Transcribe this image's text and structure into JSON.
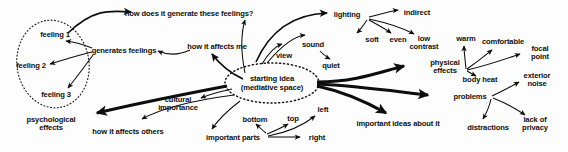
{
  "diagram": {
    "type": "mind-map",
    "title_text": "starting idea (mediative space)",
    "background_color": "#fdfdfd",
    "ink_color": "#0d0d0d",
    "center": {
      "line1": "starting idea",
      "line2": "(mediative space)"
    },
    "groups": [
      {
        "name": "feelings-group",
        "shape": "dotted-ellipse",
        "members": [
          "feeling 1",
          "feeling 2",
          "feeling 3"
        ]
      },
      {
        "name": "starting-idea-group",
        "shape": "dotted-ellipse",
        "members": [
          "starting idea (mediative space)"
        ]
      }
    ],
    "nodes": [
      {
        "id": "feeling1",
        "label": "feeling 1",
        "x": 55,
        "y": 35
      },
      {
        "id": "feeling2",
        "label": "feeling 2",
        "x": 31,
        "y": 66
      },
      {
        "id": "feeling3",
        "label": "feeling 3",
        "x": 56,
        "y": 95
      },
      {
        "id": "generates_feelings",
        "label": "generates feelings",
        "x": 124,
        "y": 51
      },
      {
        "id": "how_generate",
        "label": "how does it generate these feelings?",
        "x": 189,
        "y": 14
      },
      {
        "id": "how_affects_me",
        "label": "how it affects me",
        "x": 217,
        "y": 47
      },
      {
        "id": "view",
        "label": "view",
        "x": 284,
        "y": 56
      },
      {
        "id": "sound",
        "label": "sound",
        "x": 313,
        "y": 45
      },
      {
        "id": "quiet",
        "label": "quiet",
        "x": 331,
        "y": 66
      },
      {
        "id": "lighting",
        "label": "lighting",
        "x": 347,
        "y": 15
      },
      {
        "id": "indirect",
        "label": "indirect",
        "x": 417,
        "y": 13
      },
      {
        "id": "soft",
        "label": "soft",
        "x": 372,
        "y": 40
      },
      {
        "id": "even",
        "label": "even",
        "x": 398,
        "y": 40
      },
      {
        "id": "low_contrast",
        "label": "low\ncontrast",
        "x": 424,
        "y": 43
      },
      {
        "id": "warm",
        "label": "warm",
        "x": 466,
        "y": 39
      },
      {
        "id": "comfortable",
        "label": "comfortable",
        "x": 503,
        "y": 42
      },
      {
        "id": "focal_point",
        "label": "focal\npoint",
        "x": 540,
        "y": 53
      },
      {
        "id": "physical_effects",
        "label": "physical\neffects",
        "x": 445,
        "y": 67
      },
      {
        "id": "body_heat",
        "label": "body heat",
        "x": 480,
        "y": 80
      },
      {
        "id": "exterior_noise",
        "label": "exterior\nnoise",
        "x": 537,
        "y": 80
      },
      {
        "id": "problems",
        "label": "problems",
        "x": 470,
        "y": 97
      },
      {
        "id": "distractions",
        "label": "distractions",
        "x": 488,
        "y": 128
      },
      {
        "id": "lack_of_privacy",
        "label": "lack of\nprivacy",
        "x": 535,
        "y": 124
      },
      {
        "id": "important_ideas",
        "label": "important ideas about it",
        "x": 398,
        "y": 124
      },
      {
        "id": "center",
        "label": "starting idea\n(mediative space)",
        "x": 272,
        "y": 83
      },
      {
        "id": "cultural_importance",
        "label": "cultural\nimportance",
        "x": 178,
        "y": 104
      },
      {
        "id": "psychological",
        "label": "psychological\neffects",
        "x": 51,
        "y": 124
      },
      {
        "id": "how_affects_others",
        "label": "how it affects others",
        "x": 128,
        "y": 132
      },
      {
        "id": "important_parts",
        "label": "important parts",
        "x": 233,
        "y": 138
      },
      {
        "id": "bottom",
        "label": "bottom",
        "x": 255,
        "y": 120
      },
      {
        "id": "top",
        "label": "top",
        "x": 293,
        "y": 119
      },
      {
        "id": "left",
        "label": "left",
        "x": 323,
        "y": 110
      },
      {
        "id": "right",
        "label": "right",
        "x": 317,
        "y": 138
      }
    ],
    "edges": [
      {
        "from": "feeling1",
        "to": "how_generate",
        "weight": "medium"
      },
      {
        "from": "generates_feelings",
        "to": "feeling1",
        "weight": "thin"
      },
      {
        "from": "generates_feelings",
        "to": "feeling2",
        "weight": "thin"
      },
      {
        "from": "generates_feelings",
        "to": "feeling3",
        "weight": "thin"
      },
      {
        "from": "how_affects_me",
        "to": "generates_feelings",
        "weight": "thin"
      },
      {
        "from": "center",
        "to": "how_affects_me",
        "weight": "medium"
      },
      {
        "from": "center",
        "to": "how_generate",
        "weight": "thin"
      },
      {
        "from": "center",
        "to": "view",
        "weight": "thin"
      },
      {
        "from": "center",
        "to": "sound",
        "weight": "thin"
      },
      {
        "from": "sound",
        "to": "quiet",
        "weight": "thin"
      },
      {
        "from": "center",
        "to": "lighting",
        "weight": "medium"
      },
      {
        "from": "lighting",
        "to": "indirect",
        "weight": "thin"
      },
      {
        "from": "lighting",
        "to": "soft",
        "weight": "thin"
      },
      {
        "from": "lighting",
        "to": "even",
        "weight": "thin"
      },
      {
        "from": "lighting",
        "to": "low_contrast",
        "weight": "thin"
      },
      {
        "from": "center",
        "to": "physical_effects",
        "weight": "thick"
      },
      {
        "from": "physical_effects",
        "to": "warm",
        "weight": "thin"
      },
      {
        "from": "physical_effects",
        "to": "comfortable",
        "weight": "thin"
      },
      {
        "from": "physical_effects",
        "to": "focal_point",
        "weight": "thin"
      },
      {
        "from": "physical_effects",
        "to": "body_heat",
        "weight": "thin"
      },
      {
        "from": "center",
        "to": "problems",
        "weight": "thick"
      },
      {
        "from": "problems",
        "to": "exterior_noise",
        "weight": "thin"
      },
      {
        "from": "problems",
        "to": "distractions",
        "weight": "thin"
      },
      {
        "from": "problems",
        "to": "lack_of_privacy",
        "weight": "thin"
      },
      {
        "from": "center",
        "to": "important_ideas",
        "weight": "thick"
      },
      {
        "from": "center",
        "to": "psychological",
        "weight": "thick"
      },
      {
        "from": "center",
        "to": "cultural_importance",
        "weight": "thin"
      },
      {
        "from": "center",
        "to": "how_affects_others",
        "weight": "thin"
      },
      {
        "from": "center",
        "to": "important_parts",
        "weight": "thin"
      },
      {
        "from": "important_parts",
        "to": "bottom",
        "weight": "thin"
      },
      {
        "from": "important_parts",
        "to": "top",
        "weight": "thin"
      },
      {
        "from": "important_parts",
        "to": "left",
        "weight": "thin"
      },
      {
        "from": "important_parts",
        "to": "right",
        "weight": "thin"
      }
    ]
  }
}
